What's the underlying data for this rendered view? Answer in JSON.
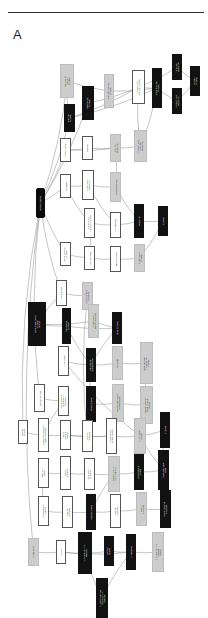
{
  "figure": {
    "panel_label": "A",
    "type": "gene-ontology-dag",
    "orientation": "rotated-90",
    "divider": "horizontal-rule",
    "legend": {
      "black_fill": "most significant term",
      "grey_fill": "moderately significant term",
      "white_fill": "non-significant ancestor term"
    },
    "colors": {
      "black_node": "#121212",
      "grey_node": "#cccccc",
      "white_node": "#ffffff",
      "border": "#4a4a4a",
      "edge": "#808080",
      "rule": "#2b2b2b",
      "text_dark": "#101010",
      "text_light": "#ffffff",
      "background": "#ffffff"
    }
  },
  "nodes": [
    {
      "id": "n0",
      "fill": "root",
      "x": 36,
      "y": 142,
      "w": 9,
      "h": 30,
      "lines": [
        "biological_process"
      ]
    },
    {
      "id": "n1",
      "fill": "grey",
      "x": 60,
      "y": 18,
      "w": 14,
      "h": 34,
      "lines": [
        "amino acid and",
        "derivative",
        "metabolic"
      ]
    },
    {
      "id": "n2",
      "fill": "black",
      "x": 64,
      "y": 58,
      "w": 11,
      "h": 28,
      "lines": [
        "amino acid",
        "metabolic"
      ]
    },
    {
      "id": "n3",
      "fill": "black",
      "x": 82,
      "y": 40,
      "w": 12,
      "h": 34,
      "lines": [
        "carboxylic acid",
        "metabolic"
      ]
    },
    {
      "id": "n4",
      "fill": "grey",
      "x": 104,
      "y": 28,
      "w": 10,
      "h": 34,
      "lines": [
        "amino acid derivative",
        "metabolic"
      ]
    },
    {
      "id": "n5",
      "fill": "white",
      "x": 132,
      "y": 24,
      "w": 13,
      "h": 34,
      "lines": [
        "glutamine family",
        "amino acid metabolic"
      ]
    },
    {
      "id": "n6",
      "fill": "black",
      "x": 152,
      "y": 22,
      "w": 10,
      "h": 40,
      "lines": [
        "cellular amino acid",
        "metabolic"
      ]
    },
    {
      "id": "n7",
      "fill": "black",
      "x": 172,
      "y": 8,
      "w": 10,
      "h": 26,
      "lines": [
        "amino acid",
        "biosynthetic"
      ]
    },
    {
      "id": "n8",
      "fill": "black",
      "x": 172,
      "y": 42,
      "w": 10,
      "h": 26,
      "lines": [
        "glutamine family",
        "biosynthetic"
      ]
    },
    {
      "id": "n9",
      "fill": "black",
      "x": 190,
      "y": 20,
      "w": 10,
      "h": 30,
      "lines": [
        "glutamine",
        "metabolic"
      ]
    },
    {
      "id": "n10",
      "fill": "white",
      "x": 60,
      "y": 92,
      "w": 11,
      "h": 24,
      "lines": [
        "amine metabolic"
      ]
    },
    {
      "id": "n11",
      "fill": "white",
      "x": 82,
      "y": 90,
      "w": 11,
      "h": 24,
      "lines": [
        "translation"
      ]
    },
    {
      "id": "n12",
      "fill": "grey",
      "x": 110,
      "y": 88,
      "w": 11,
      "h": 28,
      "lines": [
        "amine and",
        "biosynthetic"
      ]
    },
    {
      "id": "n13",
      "fill": "grey",
      "x": 134,
      "y": 84,
      "w": 13,
      "h": 32,
      "lines": [
        "glutamine family",
        "amino acid",
        "biosynthetic"
      ]
    },
    {
      "id": "n14",
      "fill": "white",
      "x": 60,
      "y": 128,
      "w": 11,
      "h": 24,
      "lines": [
        "transcription"
      ]
    },
    {
      "id": "n15",
      "fill": "white",
      "x": 82,
      "y": 124,
      "w": 12,
      "h": 30,
      "lines": [
        "macromolecule",
        "biosynthetic"
      ]
    },
    {
      "id": "n16",
      "fill": "grey",
      "x": 110,
      "y": 126,
      "w": 11,
      "h": 30,
      "lines": [
        "cellular biosynthetic"
      ]
    },
    {
      "id": "n17",
      "fill": "white",
      "x": 84,
      "y": 162,
      "w": 11,
      "h": 30,
      "lines": [
        "cellular nitrogen",
        "compound metabolic"
      ]
    },
    {
      "id": "n18",
      "fill": "white",
      "x": 110,
      "y": 166,
      "w": 11,
      "h": 26,
      "lines": [
        "gene expression"
      ]
    },
    {
      "id": "n19",
      "fill": "black",
      "x": 134,
      "y": 158,
      "w": 10,
      "h": 34,
      "lines": [
        "biosynthetic"
      ]
    },
    {
      "id": "n20",
      "fill": "black",
      "x": 158,
      "y": 160,
      "w": 10,
      "h": 30,
      "lines": [
        "metabolic"
      ]
    },
    {
      "id": "n21",
      "fill": "white",
      "x": 60,
      "y": 196,
      "w": 11,
      "h": 24,
      "lines": [
        "nitrogen compound",
        "metabolic"
      ]
    },
    {
      "id": "n22",
      "fill": "white",
      "x": 84,
      "y": 200,
      "w": 11,
      "h": 24,
      "lines": [
        "cellular metabolic"
      ]
    },
    {
      "id": "n23",
      "fill": "white",
      "x": 110,
      "y": 200,
      "w": 11,
      "h": 26,
      "lines": [
        "primary metabolic"
      ]
    },
    {
      "id": "n24",
      "fill": "grey",
      "x": 134,
      "y": 198,
      "w": 11,
      "h": 28,
      "lines": [
        "macromolecule",
        "metabolic"
      ]
    },
    {
      "id": "n25",
      "fill": "white",
      "x": 56,
      "y": 234,
      "w": 11,
      "h": 26,
      "lines": [
        "cellular process"
      ]
    },
    {
      "id": "n26",
      "fill": "grey",
      "x": 82,
      "y": 236,
      "w": 11,
      "h": 28,
      "lines": [
        "cellular component",
        "organization"
      ]
    },
    {
      "id": "n27",
      "fill": "black",
      "x": 28,
      "y": 256,
      "w": 18,
      "h": 44,
      "lines": [
        "cellular macromolecule",
        "metabolic",
        "process"
      ]
    },
    {
      "id": "n28",
      "fill": "black",
      "x": 62,
      "y": 262,
      "w": 9,
      "h": 36,
      "lines": [
        "cellular protein",
        "metabolic"
      ]
    },
    {
      "id": "n29",
      "fill": "grey",
      "x": 88,
      "y": 258,
      "w": 11,
      "h": 34,
      "lines": [
        "macromolecule",
        "biosynthetic process"
      ]
    },
    {
      "id": "n30",
      "fill": "black",
      "x": 112,
      "y": 266,
      "w": 10,
      "h": 32,
      "lines": [
        "protein metabolic"
      ]
    },
    {
      "id": "n31",
      "fill": "white",
      "x": 58,
      "y": 300,
      "w": 11,
      "h": 30,
      "lines": [
        "DNA metabolic"
      ]
    },
    {
      "id": "n32",
      "fill": "black",
      "x": 86,
      "y": 302,
      "w": 10,
      "h": 34,
      "lines": [
        "cellular protein",
        "catabolic process"
      ]
    },
    {
      "id": "n33",
      "fill": "grey",
      "x": 112,
      "y": 300,
      "w": 11,
      "h": 34,
      "lines": [
        "proteolysis"
      ]
    },
    {
      "id": "n34",
      "fill": "grey",
      "x": 140,
      "y": 296,
      "w": 13,
      "h": 42,
      "lines": [
        "protein processing,",
        "modification and",
        "catabolism"
      ]
    },
    {
      "id": "n35",
      "fill": "white",
      "x": 34,
      "y": 338,
      "w": 11,
      "h": 28,
      "lines": [
        "biological regulation"
      ]
    },
    {
      "id": "n36",
      "fill": "white",
      "x": 58,
      "y": 340,
      "w": 11,
      "h": 30,
      "lines": [
        "cellular component",
        "organization at",
        "cellular level"
      ]
    },
    {
      "id": "n37",
      "fill": "black",
      "x": 86,
      "y": 340,
      "w": 10,
      "h": 36,
      "lines": [
        "protein catabolic"
      ]
    },
    {
      "id": "n38",
      "fill": "grey",
      "x": 112,
      "y": 338,
      "w": 12,
      "h": 38,
      "lines": [
        "cellular macromolecule",
        "catabolic process"
      ]
    },
    {
      "id": "n39",
      "fill": "grey",
      "x": 140,
      "y": 340,
      "w": 13,
      "h": 38,
      "lines": [
        "ubiquitin-dependent",
        "protein catabolic",
        "process"
      ]
    },
    {
      "id": "n40",
      "fill": "white",
      "x": 18,
      "y": 374,
      "w": 10,
      "h": 24,
      "lines": [
        "biological",
        "process"
      ]
    },
    {
      "id": "n41",
      "fill": "white",
      "x": 38,
      "y": 372,
      "w": 11,
      "h": 34,
      "lines": [
        "macromolecular complex",
        "subunit organization"
      ]
    },
    {
      "id": "n42",
      "fill": "white",
      "x": 60,
      "y": 374,
      "w": 11,
      "h": 30,
      "lines": [
        "cellular",
        "component",
        "assembly"
      ]
    },
    {
      "id": "n43",
      "fill": "white",
      "x": 82,
      "y": 374,
      "w": 11,
      "h": 32,
      "lines": [
        "organelle",
        "organization"
      ]
    },
    {
      "id": "n44",
      "fill": "white",
      "x": 106,
      "y": 372,
      "w": 11,
      "h": 36,
      "lines": [
        "macromolecular",
        "complex assembly"
      ]
    },
    {
      "id": "n45",
      "fill": "grey",
      "x": 134,
      "y": 372,
      "w": 12,
      "h": 36,
      "lines": [
        "DNA metabolic",
        "process"
      ]
    },
    {
      "id": "n46",
      "fill": "black",
      "x": 160,
      "y": 366,
      "w": 10,
      "h": 36,
      "lines": [
        "DNA repair"
      ]
    },
    {
      "id": "n47",
      "fill": "white",
      "x": 38,
      "y": 412,
      "w": 11,
      "h": 30,
      "lines": [
        "response to",
        "stimulus"
      ]
    },
    {
      "id": "n48",
      "fill": "white",
      "x": 60,
      "y": 410,
      "w": 11,
      "h": 34,
      "lines": [
        "nuclear",
        "organization"
      ]
    },
    {
      "id": "n49",
      "fill": "white",
      "x": 84,
      "y": 412,
      "w": 11,
      "h": 32,
      "lines": [
        "chromosome",
        "organization"
      ]
    },
    {
      "id": "n50",
      "fill": "grey",
      "x": 108,
      "y": 410,
      "w": 12,
      "h": 36,
      "lines": [
        "response to DNA",
        "damage stimulus"
      ]
    },
    {
      "id": "n51",
      "fill": "black",
      "x": 134,
      "y": 408,
      "w": 10,
      "h": 36,
      "lines": [
        "cellular response",
        "to stress"
      ]
    },
    {
      "id": "n52",
      "fill": "black",
      "x": 158,
      "y": 404,
      "w": 11,
      "h": 40,
      "lines": [
        "double-strand break",
        "repair"
      ]
    },
    {
      "id": "n53",
      "fill": "white",
      "x": 38,
      "y": 450,
      "w": 11,
      "h": 30,
      "lines": [
        "cellular response",
        "to stimulus"
      ]
    },
    {
      "id": "n54",
      "fill": "white",
      "x": 62,
      "y": 450,
      "w": 11,
      "h": 32,
      "lines": [
        "chromatin",
        "organization"
      ]
    },
    {
      "id": "n55",
      "fill": "black",
      "x": 86,
      "y": 448,
      "w": 10,
      "h": 36,
      "lines": [
        "response to stress"
      ]
    },
    {
      "id": "n56",
      "fill": "white",
      "x": 110,
      "y": 448,
      "w": 11,
      "h": 34,
      "lines": [
        "chromatin",
        "modification"
      ]
    },
    {
      "id": "n57",
      "fill": "grey",
      "x": 136,
      "y": 446,
      "w": 11,
      "h": 34,
      "lines": [
        "histone",
        "modification"
      ]
    },
    {
      "id": "n58",
      "fill": "black",
      "x": 160,
      "y": 444,
      "w": 11,
      "h": 38,
      "lines": [
        "covalent chromatin",
        "modification"
      ]
    },
    {
      "id": "n59",
      "fill": "grey",
      "x": 28,
      "y": 492,
      "w": 11,
      "h": 28,
      "lines": [
        "cell proliferation"
      ]
    },
    {
      "id": "n60",
      "fill": "white",
      "x": 56,
      "y": 494,
      "w": 10,
      "h": 24,
      "lines": [
        "cell cycle"
      ]
    },
    {
      "id": "n61",
      "fill": "black",
      "x": 78,
      "y": 486,
      "w": 14,
      "h": 42,
      "lines": [
        "DNA-dependent DNA",
        "replication"
      ]
    },
    {
      "id": "n62",
      "fill": "black",
      "x": 104,
      "y": 490,
      "w": 10,
      "h": 30,
      "lines": [
        "cell cycle",
        "process"
      ]
    },
    {
      "id": "n63",
      "fill": "black",
      "x": 126,
      "y": 488,
      "w": 10,
      "h": 36,
      "lines": [
        "DNA replication"
      ]
    },
    {
      "id": "n64",
      "fill": "grey",
      "x": 152,
      "y": 486,
      "w": 12,
      "h": 40,
      "lines": [
        "DNA-dependent DNA",
        "replication",
        "initiation"
      ]
    },
    {
      "id": "n65",
      "fill": "black",
      "x": 96,
      "y": 532,
      "w": 12,
      "h": 40,
      "lines": [
        "DNA strand elongation",
        "involved in DNA",
        "replication"
      ]
    }
  ],
  "edges": [
    [
      "n0",
      "n1"
    ],
    [
      "n0",
      "n2"
    ],
    [
      "n0",
      "n3"
    ],
    [
      "n0",
      "n10"
    ],
    [
      "n0",
      "n14"
    ],
    [
      "n0",
      "n21"
    ],
    [
      "n0",
      "n25"
    ],
    [
      "n0",
      "n35"
    ],
    [
      "n0",
      "n40"
    ],
    [
      "n0",
      "n59"
    ],
    [
      "n1",
      "n2"
    ],
    [
      "n1",
      "n4"
    ],
    [
      "n2",
      "n5"
    ],
    [
      "n3",
      "n5"
    ],
    [
      "n2",
      "n6"
    ],
    [
      "n4",
      "n6"
    ],
    [
      "n5",
      "n6"
    ],
    [
      "n5",
      "n7"
    ],
    [
      "n6",
      "n8"
    ],
    [
      "n7",
      "n9"
    ],
    [
      "n8",
      "n9"
    ],
    [
      "n5",
      "n13"
    ],
    [
      "n10",
      "n11"
    ],
    [
      "n10",
      "n12"
    ],
    [
      "n11",
      "n12"
    ],
    [
      "n12",
      "n13"
    ],
    [
      "n13",
      "n6"
    ],
    [
      "n14",
      "n15"
    ],
    [
      "n15",
      "n16"
    ],
    [
      "n16",
      "n12"
    ],
    [
      "n14",
      "n17"
    ],
    [
      "n15",
      "n18"
    ],
    [
      "n17",
      "n18"
    ],
    [
      "n18",
      "n19"
    ],
    [
      "n19",
      "n20"
    ],
    [
      "n16",
      "n19"
    ],
    [
      "n21",
      "n22"
    ],
    [
      "n22",
      "n23"
    ],
    [
      "n23",
      "n24"
    ],
    [
      "n24",
      "n20"
    ],
    [
      "n22",
      "n17"
    ],
    [
      "n25",
      "n26"
    ],
    [
      "n25",
      "n27"
    ],
    [
      "n27",
      "n28"
    ],
    [
      "n27",
      "n29"
    ],
    [
      "n28",
      "n30"
    ],
    [
      "n29",
      "n30"
    ],
    [
      "n30",
      "n32"
    ],
    [
      "n28",
      "n32"
    ],
    [
      "n31",
      "n32"
    ],
    [
      "n32",
      "n33"
    ],
    [
      "n33",
      "n34"
    ],
    [
      "n32",
      "n37"
    ],
    [
      "n37",
      "n38"
    ],
    [
      "n38",
      "n39"
    ],
    [
      "n34",
      "n39"
    ],
    [
      "n35",
      "n36"
    ],
    [
      "n36",
      "n41"
    ],
    [
      "n40",
      "n41"
    ],
    [
      "n41",
      "n42"
    ],
    [
      "n42",
      "n43"
    ],
    [
      "n43",
      "n44"
    ],
    [
      "n42",
      "n44"
    ],
    [
      "n44",
      "n45"
    ],
    [
      "n45",
      "n46"
    ],
    [
      "n47",
      "n48"
    ],
    [
      "n48",
      "n49"
    ],
    [
      "n49",
      "n50"
    ],
    [
      "n50",
      "n51"
    ],
    [
      "n51",
      "n52"
    ],
    [
      "n45",
      "n52"
    ],
    [
      "n53",
      "n54"
    ],
    [
      "n54",
      "n55"
    ],
    [
      "n55",
      "n56"
    ],
    [
      "n56",
      "n57"
    ],
    [
      "n57",
      "n58"
    ],
    [
      "n50",
      "n55"
    ],
    [
      "n59",
      "n60"
    ],
    [
      "n60",
      "n61"
    ],
    [
      "n61",
      "n62"
    ],
    [
      "n62",
      "n63"
    ],
    [
      "n63",
      "n64"
    ],
    [
      "n63",
      "n65"
    ],
    [
      "n61",
      "n65"
    ],
    [
      "n60",
      "n63"
    ],
    [
      "n46",
      "n52"
    ],
    [
      "n26",
      "n43"
    ],
    [
      "n31",
      "n45"
    ],
    [
      "n47",
      "n53"
    ]
  ]
}
